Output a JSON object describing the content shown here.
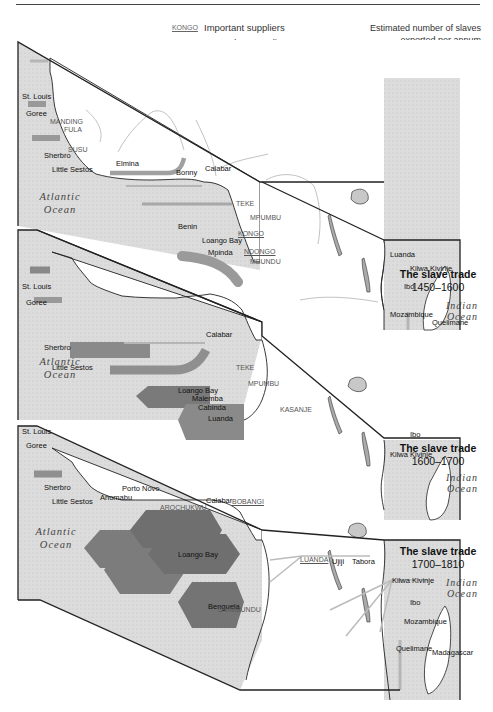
{
  "legend": {
    "items": [
      {
        "key": "KONGO",
        "label": "Important suppliers",
        "style": "underline"
      },
      {
        "key": "TEKE",
        "label": "Secondary suppliers",
        "style": "caps"
      },
      {
        "key": "Arguin",
        "label": "Slaving regions",
        "style": "italic"
      },
      {
        "key": "•",
        "label": "Slave depots",
        "style": "dot"
      },
      {
        "key": "→",
        "label": "Generalized movement of slaves",
        "style": "arrow"
      }
    ]
  },
  "scale": {
    "title_line1": "Estimated number of slaves",
    "title_line2": "exported per annum",
    "classes": [
      {
        "label": "1–500",
        "color": "#c8c8c8"
      },
      {
        "label": "501–1,000",
        "color": "#b8b8b8"
      },
      {
        "label": "1,001–5,000",
        "color": "#a8a8a8"
      },
      {
        "label": "5,001–10,000",
        "color": "#999999"
      },
      {
        "label": "10,001–15,000",
        "color": "#8a8a8a"
      },
      {
        "label": "15000+",
        "color": "#6e6e6e"
      }
    ]
  },
  "panels": [
    {
      "title": "The slave trade",
      "years": "1450–1600",
      "ocean_east": [
        "Indian",
        "Ocean"
      ],
      "ocean_west": [
        "Atlantic",
        "Ocean"
      ],
      "places": [
        "Arguin",
        "St. Louis",
        "Goree",
        "Sherbro",
        "Little Sestos",
        "Elmina",
        "Calabar",
        "Bonny",
        "Benin",
        "Loango Bay",
        "Mpinda",
        "Luanda",
        "Kilwa Kivinje",
        "Ibo",
        "Mozambique",
        "Quelimane",
        "Madagascar"
      ],
      "peoples": [
        "BAOL",
        "MANDING",
        "FULA",
        "SUSU",
        "TEKE",
        "MPUMBU",
        "KONGO",
        "NDONGO",
        "MBUNDU",
        "BENIN"
      ],
      "regions": [
        "Arguin",
        "Senegal",
        "Senegambia",
        "Bissagos Is.",
        "Sierra Leone",
        "Cape Mount",
        "Windward Coast",
        "Gold Coast",
        "Bight of Benin",
        "Bight of Biafra",
        "Loango",
        "Angola",
        "Congo",
        "Niger",
        "Benue",
        "Zambezi",
        "Mozambique"
      ]
    },
    {
      "title": "The slave trade",
      "years": "1600–1700",
      "ocean_east": [
        "Indian",
        "Ocean"
      ],
      "ocean_west": [
        "Atlantic",
        "Ocean"
      ],
      "places": [
        "St. Louis",
        "Goree",
        "Sherbro",
        "Little Sestos",
        "Elmina",
        "Cape Coast",
        "Allada",
        "Whydah",
        "Calabar",
        "Bonny",
        "Loango Bay",
        "Malemba",
        "Cabinda",
        "Luanda",
        "Kilwa Kivinje",
        "Ibo",
        "Mozambique",
        "Quelimane",
        "Madagascar"
      ],
      "peoples": [
        "WALO",
        "CAYOR",
        "BAOL",
        "MANDING",
        "FULA",
        "SUSU",
        "AKWAMU",
        "DENKYIRA",
        "FANTE",
        "OLD OYO",
        "DAHOMEY",
        "ALLADA",
        "BENIN",
        "IJEBU",
        "TEKE",
        "LOANGO",
        "MPUMBU",
        "KONGO",
        "NDONGO",
        "MBUNDU",
        "KASANJE"
      ],
      "regions": [
        "Senegambia",
        "Isles de Los",
        "Bance Is.",
        "Sierra Leone",
        "Cape Mount",
        "Windward Coast",
        "Gold Coast",
        "Bight of Benin",
        "Bight of Biafra",
        "Loango",
        "Angola",
        "Congo",
        "Benue",
        "Zambezi",
        "Mozambique"
      ]
    },
    {
      "title": "The slave trade",
      "years": "1700–1810",
      "ocean_east": [
        "Indian",
        "Ocean"
      ],
      "ocean_west": [
        "Atlantic",
        "Ocean"
      ],
      "places": [
        "St. Louis",
        "Goree",
        "Sherbro",
        "Little Sestos",
        "Anomabu",
        "Porto Novo",
        "Lagos",
        "Whydah",
        "Calabar",
        "Bonny",
        "Loango Bay",
        "Malemba",
        "Cabinda",
        "Luanda",
        "Benguela",
        "Ujiji",
        "Tabora",
        "Kilwa Kivinje",
        "Ibo",
        "Mozambique",
        "Quelimane",
        "Madagascar"
      ],
      "peoples": [
        "WALO",
        "CAYOR",
        "BAOL",
        "MANDING",
        "FULA",
        "SUSU",
        "ASANTE",
        "MAHI",
        "OLD OYO",
        "DAHOMEY",
        "BENIN",
        "AROCHUKWU",
        "BOBANGI",
        "TEKE",
        "LOANGO",
        "MPUMBU",
        "LUANDA",
        "KONGO",
        "KASANJE",
        "NDONGO",
        "MBUNDU",
        "OVIMBUNDU",
        "MARAVI"
      ],
      "regions": [
        "Senegambia",
        "Isles de Los",
        "Bance Is.",
        "Sierra Leone",
        "Cape Mount",
        "Windward Coast",
        "Gold Coast",
        "Bight of Benin",
        "Bight of Biafra",
        "Loango",
        "Congo",
        "Benue",
        "Zambezi",
        "Mozambique"
      ]
    }
  ],
  "colors": {
    "sea": "#dcdcdc",
    "land": "#ffffff",
    "frame": "#333333",
    "flow_light": "#bdbdbd",
    "flow_mid": "#9a9a9a",
    "flow_dark": "#6f6f6f"
  }
}
